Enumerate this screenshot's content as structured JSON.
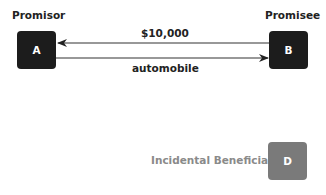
{
  "diagram": {
    "nodes": [
      {
        "id": "A",
        "label": "A",
        "role": "Promisor",
        "color": "#1c1c1c"
      },
      {
        "id": "B",
        "label": "B",
        "role": "Promisee",
        "color": "#1c1c1c"
      },
      {
        "id": "D",
        "label": "D",
        "role": "Incidental Beneficiary",
        "color": "#7a7a7a"
      }
    ],
    "edges": [
      {
        "from": "B",
        "to": "A",
        "label": "$10,000"
      },
      {
        "from": "A",
        "to": "B",
        "label": "automobile"
      }
    ]
  }
}
